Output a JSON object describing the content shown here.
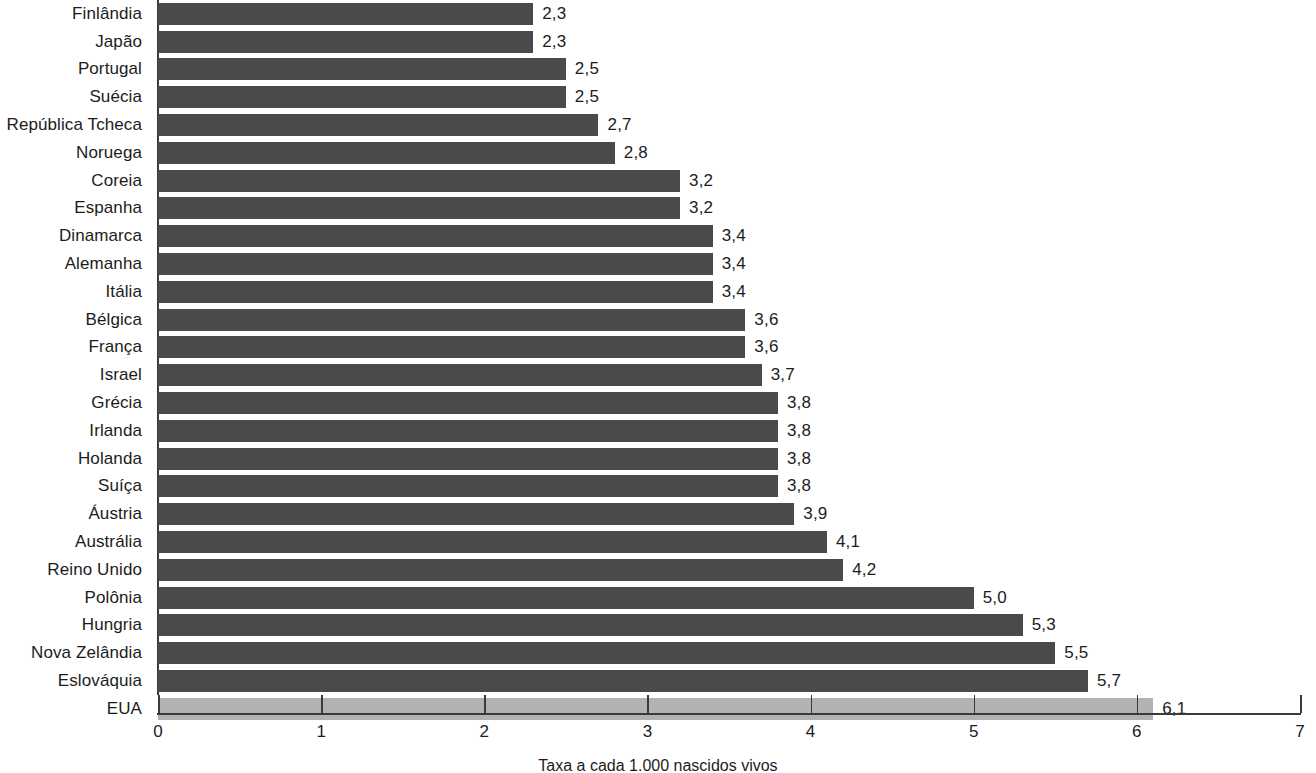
{
  "chart_data": {
    "type": "bar",
    "orientation": "horizontal",
    "title": "",
    "subtitle": "",
    "xlabel": "Taxa a cada 1.000 nascidos vivos",
    "ylabel": "",
    "xlim": [
      0,
      7
    ],
    "x_ticks": [
      "0",
      "1",
      "2",
      "3",
      "4",
      "5",
      "6",
      "7"
    ],
    "x_tick_values": [
      0,
      1,
      2,
      3,
      4,
      5,
      6,
      7
    ],
    "grid": false,
    "legend": null,
    "categories": [
      "Finlândia",
      "Japão",
      "Portugal",
      "Suécia",
      "República Tcheca",
      "Noruega",
      "Coreia",
      "Espanha",
      "Dinamarca",
      "Alemanha",
      "Itália",
      "Bélgica",
      "França",
      "Israel",
      "Grécia",
      "Irlanda",
      "Holanda",
      "Suíça",
      "Áustria",
      "Austrália",
      "Reino Unido",
      "Polônia",
      "Hungria",
      "Nova Zelândia",
      "Eslováquia",
      "EUA"
    ],
    "values": [
      2.3,
      2.3,
      2.5,
      2.5,
      2.7,
      2.8,
      3.2,
      3.2,
      3.4,
      3.4,
      3.4,
      3.6,
      3.6,
      3.7,
      3.8,
      3.8,
      3.8,
      3.8,
      3.9,
      4.1,
      4.2,
      5.0,
      5.3,
      5.5,
      5.7,
      6.1
    ],
    "value_labels": [
      "2,3",
      "2,3",
      "2,5",
      "2,5",
      "2,7",
      "2,8",
      "3,2",
      "3,2",
      "3,4",
      "3,4",
      "3,4",
      "3,6",
      "3,6",
      "3,7",
      "3,8",
      "3,8",
      "3,8",
      "3,8",
      "3,9",
      "4,1",
      "4,2",
      "5,0",
      "5,3",
      "5,5",
      "5,7",
      "6,1"
    ],
    "highlight_category": "EUA",
    "colors": {
      "bar": "#4a4a4a",
      "bar_highlight": "#b2b2b2",
      "axis": "#3a3a3a",
      "text": "#1c1c1c",
      "background": "#ffffff"
    }
  }
}
